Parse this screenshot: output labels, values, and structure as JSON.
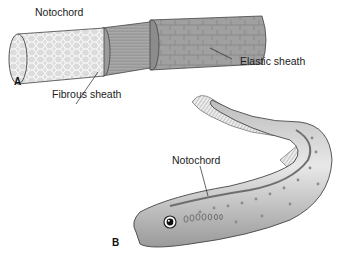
{
  "figure": {
    "panel_a": {
      "letter": "A",
      "labels": {
        "notochord": "Notochord",
        "fibrous_sheath": "Fibrous sheath",
        "elastic_sheath": "Elastic sheath"
      }
    },
    "panel_b": {
      "letter": "B",
      "labels": {
        "notochord": "Notochord"
      }
    }
  },
  "colors": {
    "background": "#ffffff",
    "ink": "#222222",
    "cell_fill": "#d6d6d6",
    "fibrous_fill": "#a8a8a8",
    "elastic_fill": "#9a9a9a",
    "body_light": "#e6e6e6",
    "body_dark": "#8a8a8a"
  }
}
